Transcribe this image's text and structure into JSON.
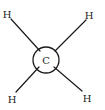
{
  "diagram": {
    "type": "molecular-structure",
    "center_atom": {
      "label": "C",
      "x": 46,
      "y": 60,
      "ring_radius": 13
    },
    "substituents": [
      {
        "label": "H",
        "position": "top-left",
        "x": 7,
        "y": 14
      },
      {
        "label": "H",
        "position": "top-right",
        "x": 89,
        "y": 15
      },
      {
        "label": "H",
        "position": "bottom-left",
        "x": 12,
        "y": 99
      },
      {
        "label": "H",
        "position": "bottom-right",
        "x": 87,
        "y": 98
      }
    ],
    "colors": {
      "line": "#1a1a1a",
      "background": "#ffffff"
    }
  }
}
